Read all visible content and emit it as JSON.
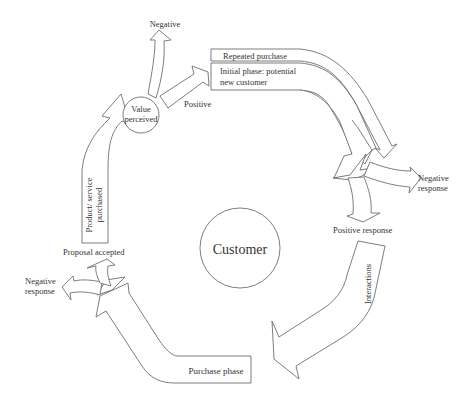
{
  "diagram": {
    "center": {
      "label": "Customer"
    },
    "nodes": {
      "value_perceived": {
        "line1": "Value",
        "line2": "perceived"
      }
    },
    "arrows": {
      "repeated_purchase": "Repeated purchase",
      "initial_phase_line1": "Initial phase: potential",
      "initial_phase_line2": "new customer",
      "interactions": "Interactions",
      "purchase_phase": "Purchase phase",
      "product_purchased_line1": "Product/ service",
      "product_purchased_line2": "purchased"
    },
    "labels": {
      "negative_top": "Negative",
      "positive_top": "Positive",
      "negative_response_right_line1": "Negative",
      "negative_response_right_line2": "response",
      "positive_response": "Positive response",
      "proposal_accepted": "Proposal accepted",
      "negative_response_left_line1": "Negative",
      "negative_response_left_line2": "response"
    },
    "colors": {
      "stroke": "#6e6e6e",
      "fill": "#ffffff",
      "text": "#333333"
    }
  }
}
